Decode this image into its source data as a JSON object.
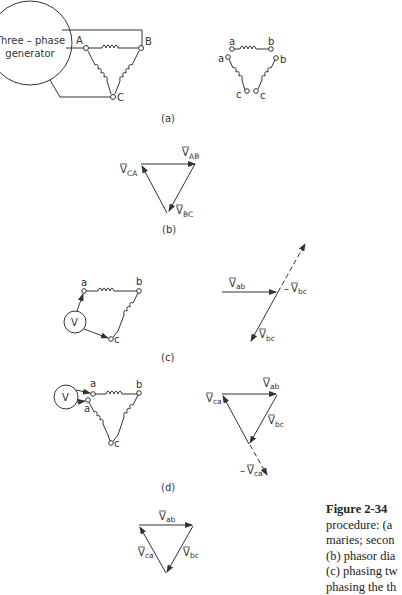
{
  "figure": {
    "number": "Figure 2-34",
    "caption_lines": [
      "procedure: (a",
      "maries; secon",
      "(b) phasor dia",
      "(c) phasing tw",
      "phasing the th"
    ]
  },
  "panels": {
    "a": {
      "label": "(a)",
      "generator_line1": "Three – phase",
      "generator_line2": "generator",
      "nodes": [
        "A",
        "B",
        "C"
      ],
      "secondary_labels": [
        "a",
        "b",
        "a",
        "b",
        "c",
        "c"
      ]
    },
    "b": {
      "label": "(b)",
      "phasors": {
        "ab": "V",
        "ab_sub": "AB",
        "bc": "V",
        "bc_sub": "BC",
        "ca": "V",
        "ca_sub": "CA"
      }
    },
    "c": {
      "label": "(c)",
      "voltmeter": "V",
      "nodes": [
        "a",
        "b",
        "c"
      ],
      "phasors": {
        "ab": "V",
        "ab_sub": "ab",
        "bc": "V",
        "bc_sub": "bc",
        "neg_bc_prefix": "–",
        "neg_bc": "V",
        "neg_bc_sub": "bc"
      }
    },
    "d": {
      "label": "(d)",
      "voltmeter": "V",
      "nodes": [
        "a",
        "b",
        "a",
        "c"
      ],
      "phasors": {
        "ab": "V",
        "ab_sub": "ab",
        "bc": "V",
        "bc_sub": "bc",
        "ca": "V",
        "ca_sub": "ca",
        "neg_ca_prefix": "–",
        "neg_ca": "V",
        "neg_ca_sub": "ca"
      }
    },
    "e": {
      "phasors": {
        "ab": "V",
        "ab_sub": "ab",
        "bc": "V",
        "bc_sub": "bc",
        "ca": "V",
        "ca_sub": "ca"
      }
    }
  }
}
